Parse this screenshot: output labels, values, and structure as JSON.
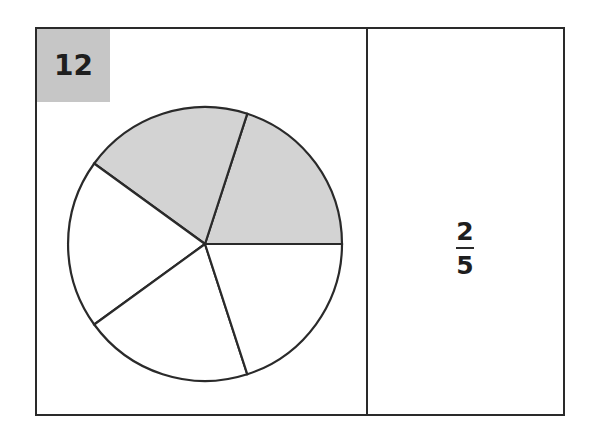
{
  "card": {
    "number_label": "12",
    "fraction": {
      "numerator": "2",
      "denominator": "5"
    }
  },
  "pie": {
    "total_slices": 5,
    "shaded_slices": 2,
    "shaded_color": "#d3d3d3",
    "unshaded_color": "#ffffff",
    "stroke_color": "#2a2a2a"
  },
  "colors": {
    "number_box": "#c6c6c6",
    "border": "#2a2a2a"
  }
}
